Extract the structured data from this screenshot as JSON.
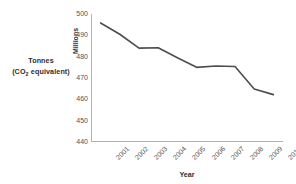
{
  "chart_data": {
    "type": "line",
    "title": "",
    "subtitle": "",
    "xlabel": "Year",
    "ylabel": "Tonnes (CO2 equivalent)",
    "unit_label": "Millions",
    "categories": [
      "2001",
      "2002",
      "2003",
      "2004",
      "2005",
      "2006",
      "2007",
      "2008",
      "2009",
      "2010"
    ],
    "values": [
      495.8,
      490.5,
      484.0,
      484.2,
      479.5,
      475.0,
      475.6,
      475.4,
      464.8,
      462.2
    ],
    "series": [
      {
        "name": "Greenhouse gas emissions",
        "values": [
          495.8,
          490.5,
          484.0,
          484.2,
          479.5,
          475.0,
          475.6,
          475.4,
          464.8,
          462.2
        ]
      }
    ],
    "ylim": [
      440,
      500
    ],
    "yticks": [
      500,
      490,
      480,
      470,
      460,
      450,
      440
    ],
    "ytick_labels": [
      "500",
      "490",
      "480",
      "470",
      "460",
      "450",
      "440"
    ],
    "grid": false,
    "legend": false,
    "legend_position": "none",
    "line_color": "#4d4d4d",
    "axis_color": "#b3b3b3"
  },
  "axis_caption": {
    "line1": "Tonnes",
    "line2_prefix": "(CO",
    "line2_sub": "2",
    "line2_suffix": " equivalent)"
  },
  "colors": {
    "background": "#ffffff",
    "line": "#4d4d4d",
    "axis": "#b3b3b3",
    "tick_text": "#555555",
    "title_text": "#2f2f2f"
  }
}
